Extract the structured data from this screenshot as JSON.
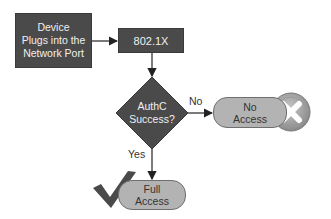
{
  "diagram": {
    "nodes": {
      "plug": {
        "label": "Device\nPlugs into the\nNetwork Port",
        "shape": "rectangle"
      },
      "dot1x": {
        "label": "802.1X",
        "shape": "rectangle"
      },
      "decision": {
        "label": "AuthC\nSuccess?",
        "shape": "diamond"
      },
      "no_access": {
        "label": "No\nAccess",
        "shape": "pill"
      },
      "full_access": {
        "label": "Full\nAccess",
        "shape": "pill"
      }
    },
    "edges": {
      "no_label": "No",
      "yes_label": "Yes"
    },
    "icons": {
      "deny": "x-circle-icon",
      "allow": "checkmark-icon"
    },
    "colors": {
      "dark_fill": "#4a4a4a",
      "pill_fill": "#b3b3b3",
      "line": "#222222"
    }
  }
}
